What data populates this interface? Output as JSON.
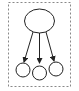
{
  "diagram": {
    "type": "tree",
    "root": {
      "id": "root",
      "shape": "ellipse",
      "label": ""
    },
    "children": [
      {
        "id": "child-1",
        "shape": "circle",
        "label": ""
      },
      {
        "id": "child-2",
        "shape": "circle",
        "label": ""
      },
      {
        "id": "child-3",
        "shape": "circle",
        "label": ""
      }
    ],
    "edges": [
      {
        "from": "root",
        "to": "child-1",
        "directed": true
      },
      {
        "from": "root",
        "to": "child-2",
        "directed": true
      },
      {
        "from": "root",
        "to": "child-3",
        "directed": true
      }
    ],
    "frame": {
      "style": "dashed"
    },
    "colors": {
      "stroke": "#222222",
      "frame": "#888888",
      "background": "#ffffff"
    }
  }
}
